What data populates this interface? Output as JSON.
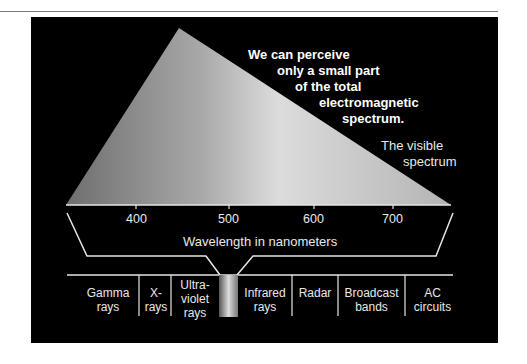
{
  "caption": {
    "lines": [
      "We can perceive",
      "only a small part",
      "of the total",
      "electromagnetic",
      "spectrum."
    ]
  },
  "visible_label": {
    "lines": [
      "The visible",
      "spectrum"
    ]
  },
  "axis": {
    "ticks": [
      "400",
      "500",
      "600",
      "700"
    ],
    "label": "Wavelength in nanometers"
  },
  "bands": [
    {
      "lines": [
        "Gamma",
        "rays"
      ]
    },
    {
      "lines": [
        "X-",
        "rays"
      ]
    },
    {
      "lines": [
        "Ultra-",
        "violet",
        "rays"
      ]
    },
    {
      "lines": [
        "Infrared",
        "rays"
      ]
    },
    {
      "lines": [
        "Radar"
      ]
    },
    {
      "lines": [
        "Broadcast",
        "bands"
      ]
    },
    {
      "lines": [
        "AC",
        "circuits"
      ]
    }
  ],
  "colors": {
    "background": "#000000",
    "line": "#e6e6e6",
    "text": "#ffffff"
  }
}
